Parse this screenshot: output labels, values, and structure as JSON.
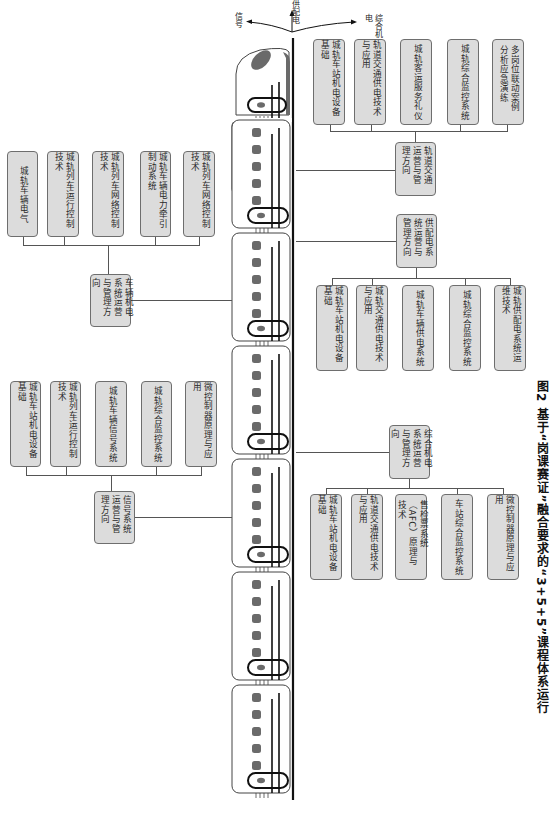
{
  "caption": "图2 基于“岗课赛证”融合要求的“3+5+5”课程体系运行",
  "direction_labels": {
    "up": "供配电",
    "left": "信号",
    "right": "综合机电"
  },
  "groups": {
    "rail_transit_operation": {
      "hub": "轨道交通运营与管理方向",
      "courses": [
        "城轨车站机电设备基础",
        "轨道交通供电技术与应用",
        "城轨客运服务礼仪",
        "城轨综合监控系统",
        "多岗位联动案例分析应急演练"
      ]
    },
    "power_supply": {
      "hub": "供配电系统运营与管理方向",
      "courses": [
        "城轨车站机电设备基础",
        "城轨交通供电技术与应用",
        "城轨车辆供电系统",
        "城轨综合监控系统",
        "城轨供配电系统运维技术"
      ]
    },
    "integrated_electromechanical": {
      "hub": "综合机电系统运营与管理方向",
      "courses": [
        "城轨车站机电设备基础",
        "轨道交通供电技术与应用",
        "售检票系统（AFC）原理与技术",
        "车站综合监控系统",
        "微控制器原理与应用"
      ]
    },
    "vehicle_electromechanical": {
      "hub": "车辆机电系统运营与管理方向",
      "courses": [
        "城轨车辆电气",
        "城轨列车运行控制技术",
        "城轨列车网络控制技术",
        "城轨车辆电力牵引制动系统",
        "城轨列车网络控制技术"
      ]
    },
    "signal_system": {
      "hub": "信号系统运营与管理方向",
      "courses": [
        "城轨车站机电设备基础",
        "城轨列车运行控制技术",
        "城轨车辆信号系统",
        "城轨综合监控系统",
        "微控制器原理与应用"
      ]
    }
  },
  "colors": {
    "box_fill": "#dcdcdc",
    "box_border": "#6e6e6e",
    "train_accent": "#6a6a6a",
    "rail": "#111111"
  }
}
